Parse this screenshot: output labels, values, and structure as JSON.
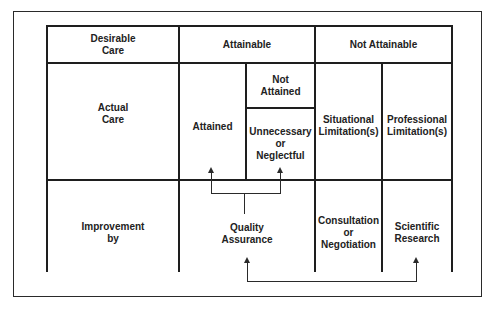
{
  "diagram": {
    "header_row": {
      "row_label": "Desirable\nCare",
      "attainable": "Attainable",
      "not_attainable": "Not Attainable"
    },
    "actual_care_row": {
      "row_label": "Actual\nCare",
      "attained": "Attained",
      "not_attained": "Not\nAttained",
      "unnecessary_or_neglectful": "Unnecessary\nor\nNeglectful",
      "situational_limitations": "Situational\nLimitation(s)",
      "professional_limitations": "Professional\nLimitation(s)"
    },
    "improvement_row": {
      "row_label": "Improvement\nby",
      "quality_assurance": "Quality\nAssurance",
      "consultation_or_negotiation": "Consultation\nor\nNegotiation",
      "scientific_research": "Scientific\nResearch"
    },
    "connectors": [
      {
        "from": "Quality Assurance",
        "to": [
          "Attained",
          "Unnecessary or Neglectful"
        ]
      },
      {
        "from": "Quality Assurance",
        "to": [
          "Scientific Research"
        ],
        "bidirectional": true
      }
    ]
  }
}
